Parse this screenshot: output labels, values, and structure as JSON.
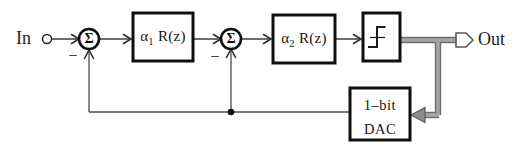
{
  "labels": {
    "input": "In",
    "output": "Out"
  },
  "summers": [
    {
      "symbol": "Σ",
      "sign": "−"
    },
    {
      "symbol": "Σ",
      "sign": "−"
    }
  ],
  "blocks": [
    {
      "alpha": "α",
      "sub": "1",
      "fn": "R(z)"
    },
    {
      "alpha": "α",
      "sub": "2",
      "fn": "R(z)"
    }
  ],
  "quantizer": {
    "icon": "step-function-icon"
  },
  "dac": {
    "line1": "1–bit",
    "line2": "DAC"
  },
  "colors": {
    "thin_line": "#2e2e2e",
    "feedback_line": "#4d4d4d",
    "block_border": "#0f0f0f",
    "thick_wire_edge": "#6f6f6f",
    "thick_wire_fill": "#a7a7a7",
    "background": "#ffffff"
  }
}
